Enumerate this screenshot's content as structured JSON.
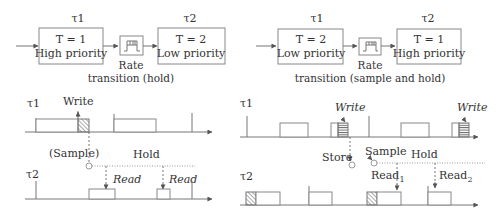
{
  "left": {
    "block1": {
      "task": "τ1",
      "period": "T = 1",
      "priority": "High priority"
    },
    "block2": {
      "task": "τ2",
      "period": "T = 2",
      "priority": "Low priority"
    },
    "transition_label_1": "Rate",
    "transition_label_2": "transition (hold)",
    "timing": {
      "row1_task": "τ1",
      "row2_task": "τ2",
      "write": "Write",
      "sample": "(Sample)",
      "hold": "Hold",
      "read1": "Read",
      "read2": "Read"
    }
  },
  "right": {
    "block1": {
      "task": "τ1",
      "period": "T = 2",
      "priority": "Low priority"
    },
    "block2": {
      "task": "τ2",
      "period": "T = 1",
      "priority": "High priority"
    },
    "transition_label_1": "Rate",
    "transition_label_2": "transition (sample and hold)",
    "timing": {
      "row1_task": "τ1",
      "row2_task": "τ2",
      "write1": "Write",
      "write2": "Write",
      "store": "Store",
      "sample": "Sample",
      "hold": "Hold",
      "read1": "Read",
      "read1_sub": "1",
      "read2": "Read",
      "read2_sub": "2"
    }
  }
}
